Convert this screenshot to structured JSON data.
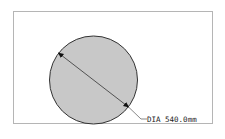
{
  "drawing": {
    "shape": "circle",
    "fill_color": "#c8c8c8",
    "stroke_color": "#333333",
    "dimension": {
      "type": "diameter",
      "label": "DIA 540.0mm",
      "prefix": "DIA",
      "value": "540.0",
      "unit": "mm"
    }
  }
}
